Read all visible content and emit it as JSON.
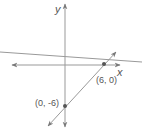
{
  "diagram": {
    "type": "coordinate-plane",
    "axes": {
      "x_label": "x",
      "y_label": "y"
    },
    "points": [
      {
        "label": "(6, 0)",
        "x": 6,
        "y": 0
      },
      {
        "label": "(0, -6)",
        "x": 0,
        "y": -6
      }
    ],
    "lines": [
      {
        "name": "line through (0, -6) and (6, 0)",
        "slope": 1,
        "intercept": -6,
        "arrows": "both"
      },
      {
        "name": "shallow sloped line",
        "arrows": "none"
      }
    ],
    "colors": {
      "stroke": "#888888",
      "point": "#555555",
      "text": "#555555"
    }
  }
}
